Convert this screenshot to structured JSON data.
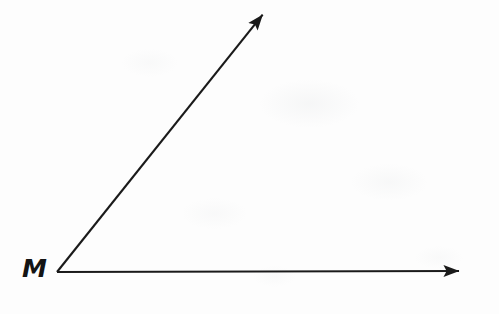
{
  "figure": {
    "kind": "geometry-angle-diagram",
    "background_color": "#fdfdfd",
    "stroke_color": "#1a1a1a",
    "stroke_width": 2.1,
    "vertex": {
      "label": "M",
      "x": 57,
      "y": 272,
      "label_x": 22,
      "label_y": 256
    },
    "rays": [
      {
        "name": "horizontal-ray",
        "from_x": 57,
        "from_y": 272,
        "to_x": 474,
        "to_y": 271,
        "arrowhead": "solid-triangle",
        "direction_degrees": 0
      },
      {
        "name": "diagonal-ray",
        "from_x": 57,
        "from_y": 272,
        "to_x": 272,
        "to_y": 3,
        "arrowhead": "solid-triangle",
        "direction_degrees": 51.4
      }
    ],
    "arrowhead": {
      "length": 15,
      "half_width": 5.6
    }
  }
}
